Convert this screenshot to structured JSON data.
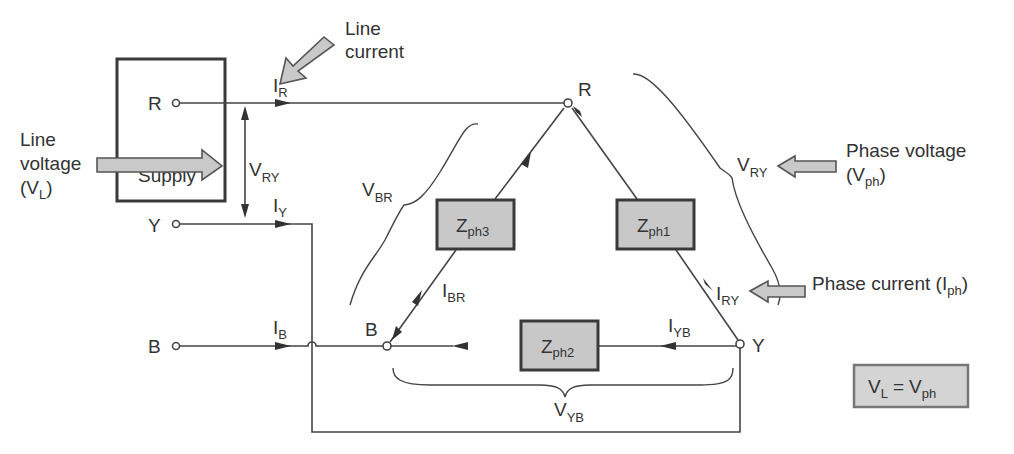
{
  "diagram": {
    "supply": {
      "label": "Supply",
      "terminals": [
        "R",
        "Y",
        "B"
      ]
    },
    "line_currents": {
      "R": {
        "main": "I",
        "sub": "R"
      },
      "Y": {
        "main": "I",
        "sub": "Y"
      },
      "B": {
        "main": "I",
        "sub": "B"
      }
    },
    "line_voltage_label": {
      "main": "V",
      "sub": "RY"
    },
    "annotations": {
      "line_current": [
        "Line",
        "current"
      ],
      "line_voltage": [
        "Line",
        "voltage",
        "(V",
        "L",
        ")"
      ],
      "phase_voltage": [
        "Phase voltage",
        "(V",
        "ph",
        ")"
      ],
      "phase_current": [
        "Phase current (I",
        "ph",
        ")"
      ]
    },
    "delta_nodes": [
      "R",
      "Y",
      "B"
    ],
    "impedances": [
      {
        "main": "Z",
        "sub": "ph1"
      },
      {
        "main": "Z",
        "sub": "ph2"
      },
      {
        "main": "Z",
        "sub": "ph3"
      }
    ],
    "phase_currents": {
      "RY": {
        "main": "I",
        "sub": "RY"
      },
      "YB": {
        "main": "I",
        "sub": "YB"
      },
      "BR": {
        "main": "I",
        "sub": "BR"
      }
    },
    "phase_voltages": {
      "RY": {
        "main": "V",
        "sub": "RY"
      },
      "YB": {
        "main": "V",
        "sub": "YB"
      },
      "BR": {
        "main": "V",
        "sub": "BR"
      }
    },
    "equation": {
      "lhs_main": "V",
      "lhs_sub": "L",
      "eq": "=",
      "rhs_main": "V",
      "rhs_sub": "ph"
    }
  }
}
